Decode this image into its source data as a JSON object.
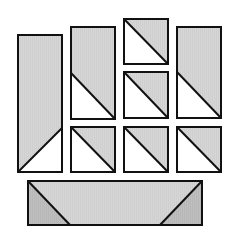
{
  "colors": {
    "background": "#ffffff",
    "fabric_light": "#d4d4d4",
    "fabric_dark": "#bdbdbd",
    "white": "#ffffff",
    "stroke": "#111111"
  },
  "pieces": [
    {
      "id": "tall-rect-left",
      "type": "rect-with-triangle",
      "x": 18,
      "y": 35,
      "w": 44,
      "h": 137,
      "triangle": [
        [
          18,
          172
        ],
        [
          62,
          128
        ],
        [
          62,
          172
        ]
      ],
      "triangle_fill": "white",
      "diagonal": [
        [
          18,
          172
        ],
        [
          62,
          128
        ]
      ]
    },
    {
      "id": "rect-col2",
      "type": "rect-with-triangle",
      "x": 71,
      "y": 27,
      "w": 44,
      "h": 92,
      "triangle": [
        [
          71,
          73
        ],
        [
          115,
          119
        ],
        [
          71,
          119
        ]
      ],
      "triangle_fill": "white",
      "diagonal": [
        [
          71,
          73
        ],
        [
          115,
          119
        ]
      ]
    },
    {
      "id": "square-top",
      "type": "hst",
      "x": 124,
      "y": 19,
      "w": 44,
      "h": 45,
      "triangle": [
        [
          124,
          19
        ],
        [
          168,
          64
        ],
        [
          124,
          64
        ]
      ],
      "triangle_fill": "white",
      "diagonal": [
        [
          124,
          19
        ],
        [
          168,
          64
        ]
      ]
    },
    {
      "id": "square-mid",
      "type": "hst",
      "x": 124,
      "y": 72,
      "w": 44,
      "h": 46,
      "triangle": [
        [
          124,
          72
        ],
        [
          168,
          118
        ],
        [
          124,
          118
        ]
      ],
      "triangle_fill": "white",
      "diagonal": [
        [
          124,
          72
        ],
        [
          168,
          118
        ]
      ]
    },
    {
      "id": "rect-right",
      "type": "rect-with-triangle",
      "x": 177,
      "y": 27,
      "w": 44,
      "h": 91,
      "triangle": [
        [
          177,
          72
        ],
        [
          221,
          118
        ],
        [
          177,
          118
        ]
      ],
      "triangle_fill": "white",
      "diagonal": [
        [
          177,
          72
        ],
        [
          221,
          118
        ]
      ]
    },
    {
      "id": "square-bottom-1",
      "type": "hst",
      "x": 71,
      "y": 127,
      "w": 44,
      "h": 45,
      "triangle": [
        [
          71,
          127
        ],
        [
          115,
          172
        ],
        [
          71,
          172
        ]
      ],
      "triangle_fill": "white",
      "diagonal": [
        [
          71,
          127
        ],
        [
          115,
          172
        ]
      ]
    },
    {
      "id": "square-bottom-2",
      "type": "hst",
      "x": 124,
      "y": 127,
      "w": 44,
      "h": 45,
      "triangle": [
        [
          124,
          127
        ],
        [
          168,
          172
        ],
        [
          124,
          172
        ]
      ],
      "triangle_fill": "white",
      "diagonal": [
        [
          124,
          127
        ],
        [
          168,
          172
        ]
      ]
    },
    {
      "id": "square-bottom-3",
      "type": "hst",
      "x": 177,
      "y": 127,
      "w": 44,
      "h": 45,
      "triangle": [
        [
          177,
          127
        ],
        [
          221,
          172
        ],
        [
          177,
          172
        ]
      ],
      "triangle_fill": "white",
      "diagonal": [
        [
          177,
          127
        ],
        [
          221,
          172
        ]
      ]
    },
    {
      "id": "flying-geese-bottom",
      "type": "rect-with-two-triangles",
      "x": 28,
      "y": 181,
      "w": 174,
      "h": 44,
      "triangles": [
        {
          "points": [
            [
              28,
              181
            ],
            [
              70,
              225
            ],
            [
              28,
              225
            ]
          ],
          "fill": "dark"
        },
        {
          "points": [
            [
              202,
              181
            ],
            [
              202,
              225
            ],
            [
              160,
              225
            ]
          ],
          "fill": "dark"
        }
      ],
      "diagonals": [
        [
          [
            28,
            181
          ],
          [
            70,
            225
          ]
        ],
        [
          [
            202,
            181
          ],
          [
            160,
            225
          ]
        ]
      ]
    }
  ]
}
